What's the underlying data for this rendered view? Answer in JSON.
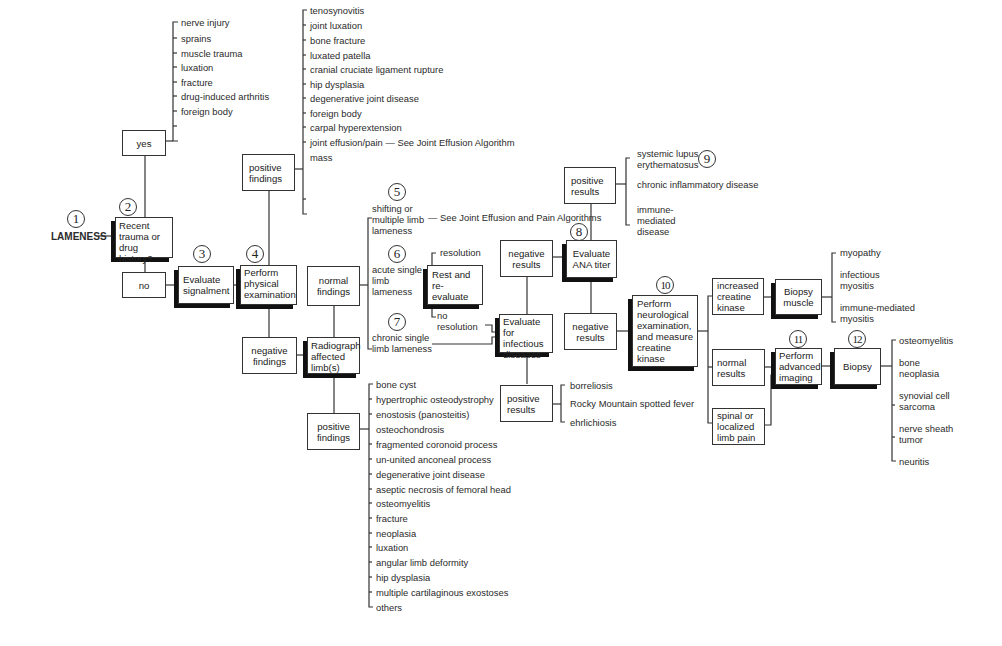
{
  "diagram": {
    "title": "LAMENESS",
    "steps": {
      "s1": "1",
      "s2": "2",
      "s3": "3",
      "s4": "4",
      "s5": "5",
      "s6": "6",
      "s7": "7",
      "s8": "8",
      "s9": "9",
      "s10": "10",
      "s11": "11",
      "s12": "12"
    },
    "boxes": {
      "recent_trauma": "Recent trauma or drug history?",
      "yes": "yes",
      "no": "no",
      "evaluate_signalment": "Evaluate signalment",
      "perform_physical": "Perform physical examination",
      "positive_findings_top": "positive findings",
      "negative_findings": "negative findings",
      "normal_findings": "normal findings",
      "radiograph": "Radiograph affected limb(s)",
      "positive_findings_bottom": "positive findings",
      "rest_reevaluate": "Rest and re-evaluate",
      "evaluate_infectious": "Evaluate for infectious diseases",
      "negative_results_infect": "negative results",
      "positive_results_infect": "positive results",
      "evaluate_ana": "Evaluate ANA titer",
      "positive_results_ana": "positive results",
      "negative_results_ana": "negative results",
      "perform_neuro": "Perform neurological examination, and measure creatine kinase",
      "increased_ck": "increased creatine kinase",
      "normal_results": "normal results",
      "spinal_pain": "spinal or localized limb pain",
      "biopsy_muscle": "Biopsy muscle",
      "advanced_imaging": "Perform advanced imaging",
      "biopsy": "Biopsy"
    },
    "trauma_causes": [
      "nerve injury",
      "sprains",
      "muscle trauma",
      "luxation",
      "fracture",
      "drug-induced arthritis",
      "foreign body"
    ],
    "physical_findings": [
      "tenosynovitis",
      "joint luxation",
      "bone fracture",
      "luxated patella",
      "cranial cruciate ligament rupture",
      "hip dysplasia",
      "degenerative joint disease",
      "foreign body",
      "carpal hyperextension",
      "joint effusion/pain — See Joint Effusion Algorithm",
      "mass"
    ],
    "lameness_types": {
      "shifting": "shifting or multiple limb lameness",
      "shifting_ref": "— See Joint Effusion and Pain Algorithms",
      "acute": "acute single limb lameness",
      "chronic": "chronic single limb lameness"
    },
    "rest_outcomes": {
      "resolution": "resolution",
      "no_resolution": "no resolution"
    },
    "radiograph_findings": [
      "bone cyst",
      "hypertrophic osteodystrophy",
      "enostosis (panosteitis)",
      "osteochondrosis",
      "fragmented coronoid process",
      "un-united anconeal process",
      "degenerative joint disease",
      "aseptic necrosis of femoral head",
      "osteomyelitis",
      "fracture",
      "neoplasia",
      "luxation",
      "angular limb deformity",
      "hip dysplasia",
      "multiple cartilaginous exostoses",
      "others"
    ],
    "infectious_diseases": [
      "borreliosis",
      "Rocky Mountain spotted fever",
      "ehrlichiosis"
    ],
    "ana_diseases": [
      "systemic lupus erythematosus",
      "chronic inflammatory disease",
      "immune-mediated disease"
    ],
    "muscle_diseases": [
      "myopathy",
      "infectious myositis",
      "immune-mediated myositis"
    ],
    "biopsy_results": [
      "osteomyelitis",
      "bone neoplasia",
      "synovial cell sarcoma",
      "nerve sheath tumor",
      "neuritis"
    ]
  }
}
